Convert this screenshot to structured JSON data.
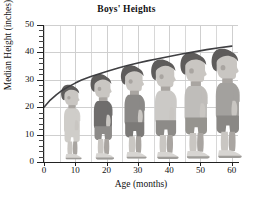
{
  "chart_data": {
    "type": "line",
    "title": "Boys' Heights",
    "xlabel": "Age (months)",
    "ylabel": "Median Height (inches)",
    "xlim": [
      0,
      62
    ],
    "ylim": [
      0,
      50
    ],
    "grid": true,
    "legend": null,
    "x_ticks": [
      0,
      10,
      20,
      30,
      40,
      50,
      60
    ],
    "x_tick_labels": [
      "0",
      "10",
      "20",
      "30",
      "40",
      "50",
      "60"
    ],
    "y_ticks": [
      0,
      10,
      20,
      30,
      40,
      50
    ],
    "y_tick_labels": [
      "0",
      "10",
      "20",
      "30",
      "40",
      "50"
    ],
    "y_minor_tick_step": 2,
    "x_minor_gridline_step": 5,
    "series": [
      {
        "name": "Median height",
        "color": "#3f3f42",
        "x": [
          0,
          2,
          4,
          6,
          8,
          10,
          12,
          15,
          18,
          20,
          24,
          27,
          30,
          33,
          36,
          40,
          44,
          48,
          52,
          56,
          60
        ],
        "y": [
          20.0,
          22.6,
          24.6,
          26.3,
          27.6,
          28.8,
          29.9,
          31.2,
          32.3,
          33.0,
          34.4,
          35.3,
          36.1,
          36.9,
          37.6,
          38.5,
          39.4,
          40.2,
          41.0,
          41.7,
          42.3
        ]
      }
    ],
    "annotations": {
      "figures": "Six illustrated boys stand on the horizontal axis at ages 10, 20, 30, 40, 50 and 60 months; the top of each boy's head meets the median-height curve.",
      "figure_ages": [
        10,
        20,
        30,
        40,
        50,
        60
      ],
      "figure_heights": [
        28.8,
        33.0,
        36.1,
        38.5,
        41.0,
        42.3
      ]
    }
  }
}
